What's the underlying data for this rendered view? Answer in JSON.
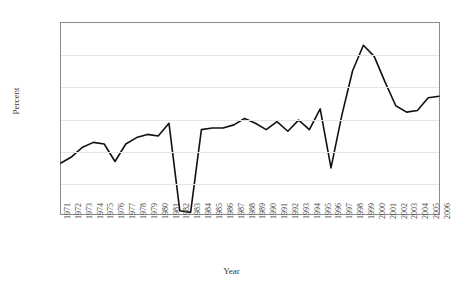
{
  "chart_data": {
    "type": "line",
    "title": "",
    "xlabel": "Year",
    "ylabel": "Percent",
    "grid": true,
    "legend": null,
    "ylim": [
      0,
      120
    ],
    "ytick_labels": [
      "0%",
      "20%",
      "40%",
      "60%",
      "80%",
      "100%",
      "120%"
    ],
    "ytick_values": [
      0,
      20,
      40,
      60,
      80,
      100,
      120
    ],
    "categories": [
      "1971",
      "1972",
      "1973",
      "1974",
      "1975",
      "1976",
      "1977",
      "1978",
      "1979",
      "1980",
      "1981",
      "1982",
      "1983",
      "1984",
      "1985",
      "1986",
      "1987",
      "1988",
      "1989",
      "1990",
      "1991",
      "1992",
      "1993",
      "1994",
      "1995",
      "1996",
      "1997",
      "1998",
      "1999",
      "2000",
      "2001",
      "2002",
      "2003",
      "2004",
      "2005",
      "2006"
    ],
    "values": [
      32,
      36,
      42,
      45,
      44,
      33,
      44,
      48,
      50,
      49,
      57,
      2,
      1,
      53,
      54,
      54,
      56,
      60,
      57,
      53,
      58,
      52,
      59,
      53,
      66,
      29,
      62,
      90,
      106,
      99,
      83,
      68,
      64,
      65,
      73,
      74
    ],
    "series_color": "#111111",
    "line_width": 2
  },
  "axes": {
    "grid_color": "#e4e4e4",
    "frame_color": "#8a8a8a"
  }
}
